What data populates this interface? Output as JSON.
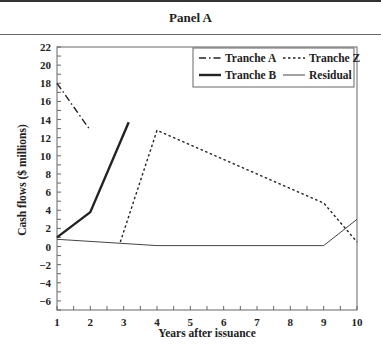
{
  "header": {
    "title": "Panel A"
  },
  "chart_data": {
    "type": "line",
    "title": "Panel A",
    "xlabel": "Years after issuance",
    "ylabel": "Cash flows ($ millions)",
    "xlim": [
      1,
      10
    ],
    "ylim": [
      -7,
      22
    ],
    "xticks": [
      1,
      2,
      3,
      4,
      5,
      6,
      7,
      8,
      9,
      10
    ],
    "yticks": [
      22,
      20,
      18,
      16,
      14,
      12,
      10,
      8,
      6,
      4,
      2,
      0,
      -2,
      -4,
      -6
    ],
    "grid": false,
    "legend_position": "upper right",
    "series": [
      {
        "name": "Tranche A",
        "style": "dash-dot",
        "width": 1.4,
        "points": [
          [
            1,
            18.0
          ],
          [
            2,
            12.8
          ]
        ]
      },
      {
        "name": "Tranche Z",
        "style": "dotted",
        "width": 1.4,
        "points": [
          [
            2.9,
            0.5
          ],
          [
            4,
            12.8
          ],
          [
            9,
            4.8
          ],
          [
            10,
            0.5
          ]
        ]
      },
      {
        "name": "Tranche B",
        "style": "solid-thick",
        "width": 2.4,
        "points": [
          [
            1,
            1.0
          ],
          [
            2,
            3.8
          ],
          [
            3.15,
            13.7
          ]
        ]
      },
      {
        "name": "Residual",
        "style": "solid-thin",
        "width": 1.0,
        "points": [
          [
            1,
            0.8
          ],
          [
            4,
            0.1
          ],
          [
            9,
            0.1
          ],
          [
            10,
            3.0
          ]
        ]
      }
    ]
  }
}
